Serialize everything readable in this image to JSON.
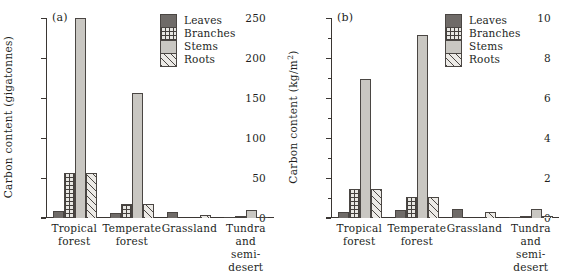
{
  "figure": {
    "panels": [
      {
        "tag": "(a)",
        "ylabel": "Carbon content (gigatonnes)",
        "ylabel_sup": ""
      },
      {
        "tag": "(b)",
        "ylabel": "Carbon content (kg/m",
        "ylabel_sup": "2",
        "ylabel_tail": ")"
      }
    ],
    "legend": {
      "items": [
        {
          "label": "Leaves",
          "key": "leaves",
          "pattern": "solid-dark-grey"
        },
        {
          "label": "Branches",
          "key": "branches",
          "pattern": "cross-hatch-grid"
        },
        {
          "label": "Stems",
          "key": "stems",
          "pattern": "solid-light-grey"
        },
        {
          "label": "Roots",
          "key": "roots",
          "pattern": "diagonal-hatch"
        }
      ]
    },
    "colors": {
      "leaves": "#6f6b68",
      "stems": "#c9c7c2",
      "branches_line": "#44403d",
      "roots_line": "#4a4643",
      "axis": "#3a3633",
      "text": "#231f1d",
      "background": "#ffffff"
    }
  },
  "chart_data": [
    {
      "type": "bar",
      "title": "(a)",
      "xlabel": "",
      "ylabel": "Carbon content (gigatonnes)",
      "ylim": [
        0,
        250
      ],
      "yticks": [
        0,
        50,
        100,
        150,
        200,
        250
      ],
      "ytick_labels": [
        "0",
        "50",
        "100",
        "150",
        "200",
        "250"
      ],
      "yminor_ticks": [],
      "grid": false,
      "legend_position": "top-right",
      "categories": [
        "Tropical forest",
        "Temperate forest",
        "Grassland",
        "Tundra and semi-desert"
      ],
      "series": [
        {
          "name": "Leaves",
          "values": [
            9,
            6,
            7,
            1
          ]
        },
        {
          "name": "Branches",
          "values": [
            56,
            18,
            0,
            2
          ]
        },
        {
          "name": "Stems",
          "values": [
            250,
            156,
            0,
            10
          ]
        },
        {
          "name": "Roots",
          "values": [
            56,
            18,
            4,
            1
          ]
        }
      ]
    },
    {
      "type": "bar",
      "title": "(b)",
      "xlabel": "",
      "ylabel": "Carbon content (kg/m2)",
      "ylim": [
        0,
        10
      ],
      "yticks": [
        0,
        2,
        4,
        6,
        8,
        10
      ],
      "ytick_labels": [
        "0",
        "2",
        "4",
        "6",
        "8",
        "10"
      ],
      "yminor_ticks": [
        1,
        3,
        5,
        7,
        9
      ],
      "grid": false,
      "legend_position": "top-right",
      "categories": [
        "Tropical forest",
        "Temperate forest",
        "Grassland",
        "Tundra and semi-desert"
      ],
      "series": [
        {
          "name": "Leaves",
          "values": [
            0.3,
            0.4,
            0.45,
            0.07
          ]
        },
        {
          "name": "Branches",
          "values": [
            1.45,
            1.05,
            0,
            0.12
          ]
        },
        {
          "name": "Stems",
          "values": [
            6.95,
            9.15,
            0,
            0.47
          ]
        },
        {
          "name": "Roots",
          "values": [
            1.45,
            1.05,
            0.3,
            0.1
          ]
        }
      ]
    }
  ],
  "categories_wrapped": [
    [
      "Tropical",
      "forest"
    ],
    [
      "Temperate",
      "forest"
    ],
    [
      "Grassland",
      ""
    ],
    [
      "Tundra and",
      "semi-desert"
    ]
  ]
}
